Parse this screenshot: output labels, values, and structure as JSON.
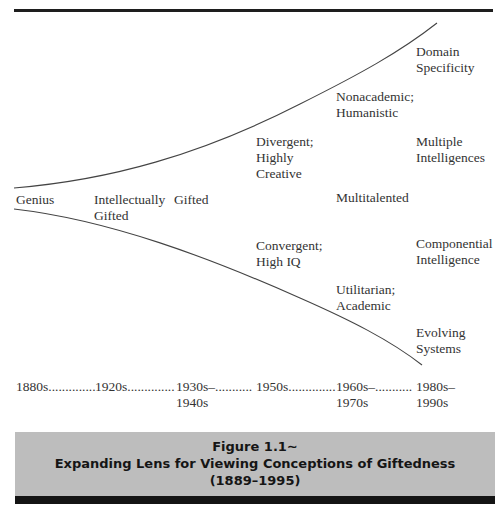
{
  "diagram": {
    "type": "expanding-lens",
    "top_rule": true,
    "upper_curve": {
      "color": "#444444"
    },
    "lower_curve": {
      "color": "#444444"
    },
    "labels": [
      {
        "id": "genius",
        "text": "Genius",
        "period": "1880s"
      },
      {
        "id": "intellectually-gifted",
        "text": "Intellectually\nGifted",
        "period": "1920s"
      },
      {
        "id": "gifted",
        "text": "Gifted",
        "period": "1930s–1940s"
      },
      {
        "id": "divergent",
        "text": "Divergent;\nHighly\nCreative",
        "period": "1950s"
      },
      {
        "id": "convergent",
        "text": "Convergent;\nHigh IQ",
        "period": "1950s"
      },
      {
        "id": "nonacademic",
        "text": "Nonacademic;\nHumanistic",
        "period": "1960s–1970s"
      },
      {
        "id": "multitalented",
        "text": "Multitalented",
        "period": "1960s–1970s"
      },
      {
        "id": "utilitarian",
        "text": "Utilitarian;\nAcademic",
        "period": "1960s–1970s"
      },
      {
        "id": "domain-specificity",
        "text": "Domain\nSpecificity",
        "period": "1980s–1990s"
      },
      {
        "id": "multiple-intelligences",
        "text": "Multiple\nIntelligences",
        "period": "1980s–1990s"
      },
      {
        "id": "componential-intelligence",
        "text": "Componential\nIntelligence",
        "period": "1980s–1990s"
      },
      {
        "id": "evolving-systems",
        "text": "Evolving\nSystems",
        "period": "1980s–1990s"
      }
    ],
    "timeline": [
      {
        "text": "1880s.............."
      },
      {
        "text": "1920s.............."
      },
      {
        "text": "1930s–...........\n1940s"
      },
      {
        "text": "1950s.............."
      },
      {
        "text": "1960s–...........\n1970s"
      },
      {
        "text": "1980s–\n1990s"
      }
    ]
  },
  "caption": {
    "line1": "Figure 1.1∼",
    "line2": "Expanding Lens for Viewing Conceptions of Giftedness",
    "line3": "(1889–1995)",
    "background": "#bdbdbd",
    "bar_color": "#141414"
  }
}
